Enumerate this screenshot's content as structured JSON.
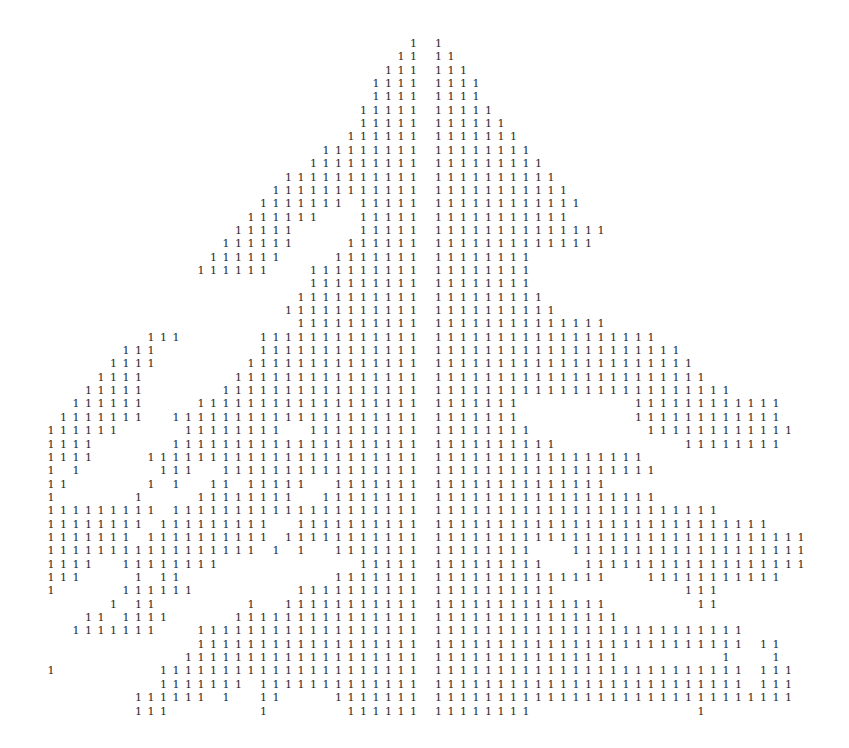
{
  "printout": {
    "glyph": "1",
    "ink_color": "#2a2a2a",
    "paper_color": "#ffffff",
    "grid": {
      "columns": 61,
      "rows": 51,
      "origin_x": 47,
      "origin_y": 38,
      "col_step": 12.5,
      "row_step": 13.35
    },
    "rows": [
      [
        [
          29,
          29
        ],
        [
          31,
          31
        ]
      ],
      [
        [
          28,
          29
        ],
        [
          31,
          32
        ]
      ],
      [
        [
          27,
          29
        ],
        [
          31,
          33
        ]
      ],
      [
        [
          26,
          29
        ],
        [
          31,
          34
        ]
      ],
      [
        [
          26,
          29
        ],
        [
          31,
          34
        ]
      ],
      [
        [
          25,
          29
        ],
        [
          31,
          35
        ]
      ],
      [
        [
          25,
          29
        ],
        [
          31,
          36
        ]
      ],
      [
        [
          24,
          29
        ],
        [
          31,
          37
        ]
      ],
      [
        [
          22,
          29
        ],
        [
          31,
          38
        ]
      ],
      [
        [
          21,
          29
        ],
        [
          31,
          39
        ]
      ],
      [
        [
          19,
          29
        ],
        [
          31,
          40
        ]
      ],
      [
        [
          18,
          29
        ],
        [
          31,
          41
        ]
      ],
      [
        [
          17,
          23
        ],
        [
          25,
          29
        ],
        [
          31,
          42
        ]
      ],
      [
        [
          16,
          21
        ],
        [
          25,
          29
        ],
        [
          31,
          41
        ]
      ],
      [
        [
          15,
          19
        ],
        [
          25,
          29
        ],
        [
          31,
          44
        ]
      ],
      [
        [
          14,
          19
        ],
        [
          24,
          29
        ],
        [
          31,
          43
        ]
      ],
      [
        [
          13,
          18
        ],
        [
          23,
          29
        ],
        [
          31,
          38
        ]
      ],
      [
        [
          12,
          17
        ],
        [
          21,
          29
        ],
        [
          31,
          38
        ]
      ],
      [
        [
          21,
          29
        ],
        [
          31,
          38
        ]
      ],
      [
        [
          20,
          29
        ],
        [
          31,
          39
        ]
      ],
      [
        [
          19,
          29
        ],
        [
          31,
          40
        ]
      ],
      [
        [
          20,
          29
        ],
        [
          31,
          44
        ]
      ],
      [
        [
          8,
          10
        ],
        [
          17,
          29
        ],
        [
          31,
          48
        ]
      ],
      [
        [
          6,
          8
        ],
        [
          17,
          29
        ],
        [
          31,
          50
        ]
      ],
      [
        [
          5,
          8
        ],
        [
          16,
          29
        ],
        [
          31,
          51
        ]
      ],
      [
        [
          4,
          7
        ],
        [
          15,
          29
        ],
        [
          31,
          52
        ]
      ],
      [
        [
          3,
          7
        ],
        [
          14,
          29
        ],
        [
          31,
          54
        ]
      ],
      [
        [
          2,
          7
        ],
        [
          12,
          29
        ],
        [
          31,
          37
        ],
        [
          47,
          58
        ]
      ],
      [
        [
          1,
          7
        ],
        [
          10,
          29
        ],
        [
          31,
          37
        ],
        [
          47,
          58
        ]
      ],
      [
        [
          0,
          5
        ],
        [
          11,
          18
        ],
        [
          21,
          29
        ],
        [
          31,
          38
        ],
        [
          48,
          59
        ]
      ],
      [
        [
          0,
          3
        ],
        [
          10,
          29
        ],
        [
          31,
          40
        ],
        [
          51,
          58
        ]
      ],
      [
        [
          0,
          3
        ],
        [
          8,
          29
        ],
        [
          31,
          47
        ]
      ],
      [
        [
          0,
          0
        ],
        [
          2,
          2
        ],
        [
          9,
          11
        ],
        [
          14,
          29
        ],
        [
          31,
          48
        ]
      ],
      [
        [
          0,
          1
        ],
        [
          8,
          8
        ],
        [
          10,
          10
        ],
        [
          13,
          14
        ],
        [
          16,
          20
        ],
        [
          23,
          29
        ],
        [
          31,
          44
        ]
      ],
      [
        [
          0,
          0
        ],
        [
          7,
          7
        ],
        [
          12,
          19
        ],
        [
          22,
          29
        ],
        [
          31,
          48
        ]
      ],
      [
        [
          0,
          8
        ],
        [
          10,
          29
        ],
        [
          31,
          53
        ]
      ],
      [
        [
          0,
          7
        ],
        [
          9,
          17
        ],
        [
          20,
          29
        ],
        [
          31,
          57
        ]
      ],
      [
        [
          0,
          6
        ],
        [
          8,
          17
        ],
        [
          19,
          29
        ],
        [
          31,
          60
        ]
      ],
      [
        [
          0,
          16
        ],
        [
          18,
          18
        ],
        [
          20,
          20
        ],
        [
          23,
          29
        ],
        [
          31,
          38
        ],
        [
          42,
          60
        ]
      ],
      [
        [
          0,
          3
        ],
        [
          6,
          13
        ],
        [
          25,
          29
        ],
        [
          31,
          39
        ],
        [
          43,
          60
        ]
      ],
      [
        [
          0,
          2
        ],
        [
          7,
          7
        ],
        [
          9,
          10
        ],
        [
          23,
          29
        ],
        [
          31,
          44
        ],
        [
          48,
          58
        ]
      ],
      [
        [
          0,
          0
        ],
        [
          6,
          11
        ],
        [
          20,
          29
        ],
        [
          31,
          40
        ],
        [
          51,
          53
        ]
      ],
      [
        [
          5,
          5
        ],
        [
          7,
          8
        ],
        [
          16,
          16
        ],
        [
          19,
          29
        ],
        [
          31,
          44
        ],
        [
          52,
          53
        ]
      ],
      [
        [
          3,
          4
        ],
        [
          6,
          9
        ],
        [
          15,
          29
        ],
        [
          31,
          45
        ]
      ],
      [
        [
          2,
          8
        ],
        [
          12,
          29
        ],
        [
          31,
          55
        ]
      ],
      [
        [
          12,
          29
        ],
        [
          31,
          55
        ],
        [
          57,
          58
        ]
      ],
      [
        [
          11,
          29
        ],
        [
          31,
          45
        ],
        [
          54,
          54
        ],
        [
          58,
          58
        ]
      ],
      [
        [
          0,
          0
        ],
        [
          9,
          29
        ],
        [
          31,
          55
        ],
        [
          57,
          59
        ]
      ],
      [
        [
          9,
          15
        ],
        [
          17,
          29
        ],
        [
          31,
          55
        ],
        [
          57,
          59
        ]
      ],
      [
        [
          7,
          12
        ],
        [
          14,
          14
        ],
        [
          17,
          18
        ],
        [
          23,
          29
        ],
        [
          31,
          59
        ]
      ],
      [
        [
          7,
          9
        ],
        [
          17,
          17
        ],
        [
          24,
          29
        ],
        [
          31,
          38
        ],
        [
          52,
          52
        ]
      ]
    ]
  }
}
